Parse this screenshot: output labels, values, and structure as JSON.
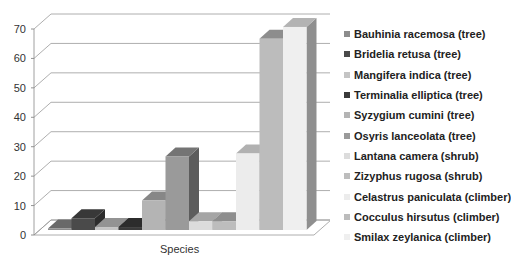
{
  "chart_data": {
    "type": "bar",
    "title": "",
    "xlabel": "Species",
    "ylabel": "",
    "ylim": [
      0,
      70
    ],
    "yticks": [
      0,
      10,
      20,
      30,
      40,
      50,
      60,
      70
    ],
    "grid": true,
    "three_d": true,
    "legend_position": "right",
    "categories": [
      "Species"
    ],
    "series": [
      {
        "name": "Bauhinia racemosa (tree)",
        "values": [
          0.5
        ],
        "color": "#8c8c8c"
      },
      {
        "name": "Bridelia retusa (tree)",
        "values": [
          4
        ],
        "color": "#4a4a4a"
      },
      {
        "name": "Mangifera indica (tree)",
        "values": [
          1
        ],
        "color": "#c4c4c4"
      },
      {
        "name": "Terminalia elliptica (tree)",
        "values": [
          1
        ],
        "color": "#3a3a3a"
      },
      {
        "name": "Syzygium cumini (tree)",
        "values": [
          10
        ],
        "color": "#b4b4b4"
      },
      {
        "name": "Osyris lanceolata (tree)",
        "values": [
          25
        ],
        "color": "#9a9a9a"
      },
      {
        "name": "Lantana camera (shrub)",
        "values": [
          3
        ],
        "color": "#dcdcdc"
      },
      {
        "name": "Zizyphus rugosa (shrub)",
        "values": [
          3
        ],
        "color": "#bdbdbd"
      },
      {
        "name": "Celastrus paniculata (climber)",
        "values": [
          26
        ],
        "color": "#ececec"
      },
      {
        "name": "Cocculus hirsutus (climber)",
        "values": [
          65
        ],
        "color": "#bcbcbc"
      },
      {
        "name": "Smilax zeylanica (climber)",
        "values": [
          69
        ],
        "color": "#efefef"
      }
    ]
  }
}
